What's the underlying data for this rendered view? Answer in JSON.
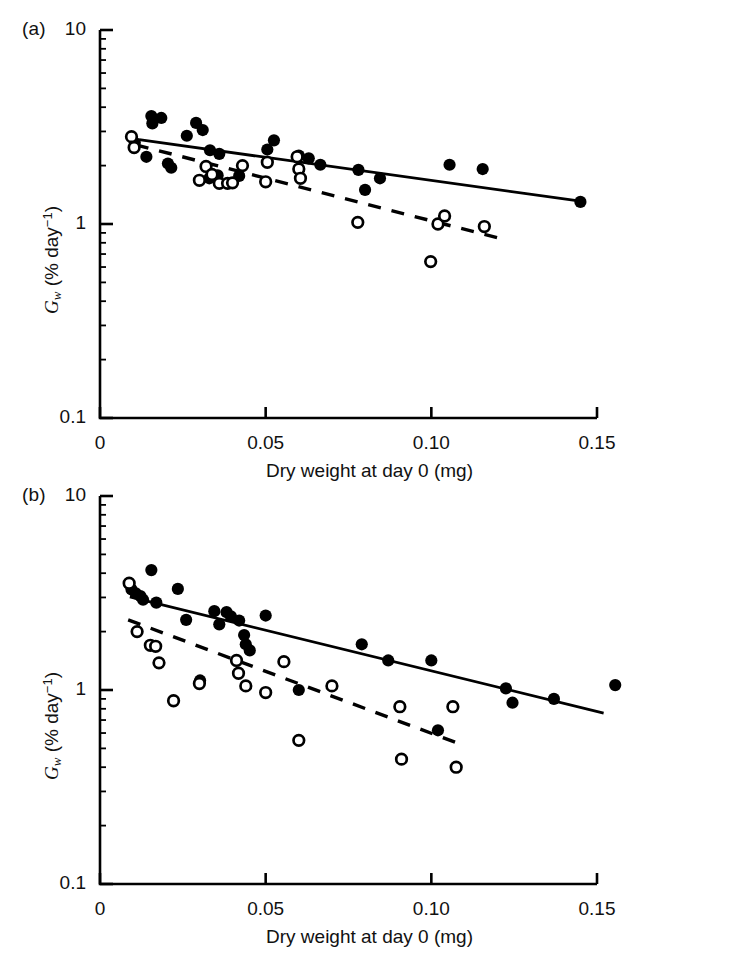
{
  "figure": {
    "panels": [
      {
        "label": "(a)",
        "ylabel": "G_w (% day^-1)",
        "ylabel_parts": {
          "symbol": "G",
          "subscript": "w",
          "unit_open": " (% day",
          "superscript": "−1",
          "unit_close": ")"
        },
        "xlabel": "Dry weight at day 0 (mg)",
        "ytick_labels": [
          "10",
          "1",
          "0.1"
        ],
        "xtick_labels": [
          "0",
          "0.05",
          "0.10",
          "0.15"
        ]
      },
      {
        "label": "(b)",
        "ylabel": "G_w (% day^-1)",
        "ylabel_parts": {
          "symbol": "G",
          "subscript": "w",
          "unit_open": " (% day",
          "superscript": "−1",
          "unit_close": ")"
        },
        "xlabel": "Dry weight at day 0 (mg)",
        "ytick_labels": [
          "10",
          "1",
          "0.1"
        ],
        "xtick_labels": [
          "0",
          "0.05",
          "0.10",
          "0.15"
        ]
      }
    ]
  },
  "chart_data": [
    {
      "type": "scatter",
      "panel": "(a)",
      "title": "",
      "xlabel": "Dry weight at day 0 (mg)",
      "ylabel": "Gw (% day-1)",
      "xlim": [
        0,
        0.1626
      ],
      "ylim": [
        0.1,
        10
      ],
      "yscale": "log",
      "xscale": "linear",
      "xticks": [
        0,
        0.05,
        0.1,
        0.15
      ],
      "yticks": [
        0.1,
        1,
        10
      ],
      "grid": false,
      "legend": "none",
      "series": [
        {
          "name": "filled-circles",
          "marker": "filled-circle",
          "color": "#000000",
          "points": [
            [
              0.0105,
              2.62
            ],
            [
              0.014,
              2.22
            ],
            [
              0.0155,
              3.6
            ],
            [
              0.0158,
              3.3
            ],
            [
              0.0185,
              3.52
            ],
            [
              0.0205,
              2.05
            ],
            [
              0.0215,
              1.95
            ],
            [
              0.0262,
              2.85
            ],
            [
              0.029,
              3.32
            ],
            [
              0.031,
              3.05
            ],
            [
              0.033,
              1.72
            ],
            [
              0.0332,
              2.4
            ],
            [
              0.0355,
              1.78
            ],
            [
              0.036,
              2.3
            ],
            [
              0.042,
              1.77
            ],
            [
              0.0505,
              2.42
            ],
            [
              0.0525,
              2.7
            ],
            [
              0.06,
              2.25
            ],
            [
              0.063,
              2.18
            ],
            [
              0.0665,
              2.02
            ],
            [
              0.078,
              1.9
            ],
            [
              0.08,
              1.5
            ],
            [
              0.0845,
              1.72
            ],
            [
              0.1055,
              2.02
            ],
            [
              0.1155,
              1.92
            ],
            [
              0.145,
              1.3
            ]
          ]
        },
        {
          "name": "open-circles",
          "marker": "open-circle",
          "color": "#000000",
          "points": [
            [
              0.0095,
              2.82
            ],
            [
              0.0103,
              2.48
            ],
            [
              0.03,
              1.68
            ],
            [
              0.032,
              1.98
            ],
            [
              0.0338,
              1.8
            ],
            [
              0.036,
              1.62
            ],
            [
              0.0385,
              1.62
            ],
            [
              0.04,
              1.63
            ],
            [
              0.043,
              2.0
            ],
            [
              0.05,
              1.65
            ],
            [
              0.0505,
              2.08
            ],
            [
              0.0595,
              2.22
            ],
            [
              0.06,
              1.92
            ],
            [
              0.0605,
              1.72
            ],
            [
              0.0778,
              1.02
            ],
            [
              0.0998,
              0.64
            ],
            [
              0.102,
              1.0
            ],
            [
              0.104,
              1.1
            ],
            [
              0.116,
              0.97
            ]
          ]
        }
      ],
      "fits": [
        {
          "name": "solid-regression",
          "style": "solid",
          "x": [
            0.0118,
            0.1466
          ],
          "y": [
            2.72,
            1.3
          ]
        },
        {
          "name": "dashed-regression",
          "style": "dashed",
          "x": [
            0.0108,
            0.121
          ],
          "y": [
            2.56,
            0.84
          ]
        }
      ]
    },
    {
      "type": "scatter",
      "panel": "(b)",
      "title": "",
      "xlabel": "Dry weight at day 0 (mg)",
      "ylabel": "Gw (% day-1)",
      "xlim": [
        0,
        0.1626
      ],
      "ylim": [
        0.1,
        10
      ],
      "yscale": "log",
      "xscale": "linear",
      "xticks": [
        0,
        0.05,
        0.1,
        0.15
      ],
      "yticks": [
        0.1,
        1,
        10
      ],
      "grid": false,
      "legend": "none",
      "series": [
        {
          "name": "filled-circles",
          "marker": "filled-circle",
          "color": "#000000",
          "points": [
            [
              0.0095,
              3.3
            ],
            [
              0.0108,
              3.15
            ],
            [
              0.0122,
              3.05
            ],
            [
              0.013,
              2.92
            ],
            [
              0.0155,
              4.15
            ],
            [
              0.017,
              2.82
            ],
            [
              0.0235,
              3.32
            ],
            [
              0.026,
              2.3
            ],
            [
              0.0302,
              1.12
            ],
            [
              0.0345,
              2.55
            ],
            [
              0.036,
              2.18
            ],
            [
              0.0382,
              2.52
            ],
            [
              0.0395,
              2.4
            ],
            [
              0.042,
              2.28
            ],
            [
              0.0435,
              1.92
            ],
            [
              0.044,
              1.72
            ],
            [
              0.0452,
              1.6
            ],
            [
              0.05,
              2.42
            ],
            [
              0.06,
              1.0
            ],
            [
              0.079,
              1.72
            ],
            [
              0.087,
              1.42
            ],
            [
              0.1,
              1.42
            ],
            [
              0.102,
              0.62
            ],
            [
              0.1225,
              1.02
            ],
            [
              0.1245,
              0.86
            ],
            [
              0.137,
              0.9
            ],
            [
              0.1555,
              1.06
            ]
          ]
        },
        {
          "name": "open-circles",
          "marker": "open-circle",
          "color": "#000000",
          "points": [
            [
              0.0088,
              3.55
            ],
            [
              0.0112,
              2.0
            ],
            [
              0.0152,
              1.7
            ],
            [
              0.0168,
              1.68
            ],
            [
              0.0178,
              1.38
            ],
            [
              0.0222,
              0.88
            ],
            [
              0.03,
              1.08
            ],
            [
              0.0412,
              1.42
            ],
            [
              0.0418,
              1.22
            ],
            [
              0.044,
              1.05
            ],
            [
              0.05,
              0.97
            ],
            [
              0.0555,
              1.4
            ],
            [
              0.06,
              0.55
            ],
            [
              0.07,
              1.05
            ],
            [
              0.0905,
              0.82
            ],
            [
              0.091,
              0.44
            ],
            [
              0.1065,
              0.82
            ],
            [
              0.1075,
              0.4
            ]
          ]
        }
      ],
      "fits": [
        {
          "name": "solid-regression",
          "style": "solid",
          "x": [
            0.009,
            0.152
          ],
          "y": [
            3.02,
            0.76
          ]
        },
        {
          "name": "dashed-regression",
          "style": "dashed",
          "x": [
            0.0085,
            0.1095
          ],
          "y": [
            2.3,
            0.52
          ]
        }
      ]
    }
  ]
}
